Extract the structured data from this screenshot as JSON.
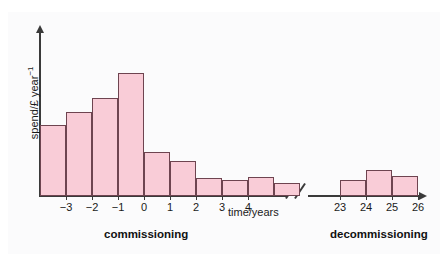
{
  "chart_data": {
    "type": "bar",
    "title": "",
    "subtitle": "",
    "xlabel": "time/years",
    "ylabel": "spend/£ year⁻¹",
    "grid": false,
    "legend_position": "none",
    "axis_break": "//",
    "axis_break_note": "x-axis broken between year 5 and year 22",
    "ylim": [
      0,
      100
    ],
    "xlim_segments": [
      [
        -4,
        5
      ],
      [
        22,
        27
      ]
    ],
    "y_axis_ticks_shown": false,
    "annotations": [
      {
        "text": "commissioning",
        "bold": true,
        "position": "below-left-segment"
      },
      {
        "text": "decommissioning",
        "bold": true,
        "position": "below-right-segment"
      }
    ],
    "xtick_labels_left": [
      "-3",
      "-2",
      "-1",
      "0",
      "1",
      "2",
      "3",
      "4"
    ],
    "xtick_labels_right": [
      "23",
      "24",
      "25",
      "26"
    ],
    "bar_color": "#f9ccd7",
    "bar_edge_color": "#6e4450",
    "axis_color": "#3a3a3a",
    "bars": [
      {
        "group": "commissioning",
        "bin_start": -4,
        "bin_end": -3,
        "label": "-4 to -3",
        "value": 43
      },
      {
        "group": "commissioning",
        "bin_start": -3,
        "bin_end": -2,
        "label": "-3 to -2",
        "value": 51
      },
      {
        "group": "commissioning",
        "bin_start": -2,
        "bin_end": -1,
        "label": "-2 to -1",
        "value": 59
      },
      {
        "group": "commissioning",
        "bin_start": -1,
        "bin_end": 0,
        "label": "-1 to 0",
        "value": 74
      },
      {
        "group": "commissioning",
        "bin_start": 0,
        "bin_end": 1,
        "label": "0 to 1",
        "value": 26
      },
      {
        "group": "commissioning",
        "bin_start": 1,
        "bin_end": 2,
        "label": "1 to 2",
        "value": 21
      },
      {
        "group": "commissioning",
        "bin_start": 2,
        "bin_end": 3,
        "label": "2 to 3",
        "value": 10
      },
      {
        "group": "commissioning",
        "bin_start": 3,
        "bin_end": 4,
        "label": "3 to 4",
        "value": 9
      },
      {
        "group": "commissioning",
        "bin_start": 4,
        "bin_end": 5,
        "label": "4 to 5",
        "value": 11
      },
      {
        "group": "commissioning",
        "bin_start": 5,
        "bin_end": 6,
        "label": "5 to 6",
        "value": 7
      },
      {
        "group": "decommissioning",
        "bin_start": 23,
        "bin_end": 24,
        "label": "23 to 24",
        "value": 9
      },
      {
        "group": "decommissioning",
        "bin_start": 24,
        "bin_end": 25,
        "label": "24 to 25",
        "value": 15
      },
      {
        "group": "decommissioning",
        "bin_start": 25,
        "bin_end": 26,
        "label": "25 to 26",
        "value": 11
      }
    ]
  },
  "labels": {
    "ylabel_main": "spend/£ year",
    "ylabel_exponent": "−1",
    "xlabel": "time/years",
    "commissioning": "commissioning",
    "decommissioning": "decommissioning"
  },
  "xticks_left": [
    {
      "label": "-3",
      "x": 66
    },
    {
      "label": "-2",
      "x": 92
    },
    {
      "label": "-1",
      "x": 118
    },
    {
      "label": "0",
      "x": 144
    },
    {
      "label": "1",
      "x": 170
    },
    {
      "label": "2",
      "x": 196
    },
    {
      "label": "3",
      "x": 222
    },
    {
      "label": "4",
      "x": 248
    }
  ],
  "xticks_right": [
    {
      "label": "23",
      "x": 340
    },
    {
      "label": "24",
      "x": 366
    },
    {
      "label": "25",
      "x": 392
    },
    {
      "label": "26",
      "x": 418
    }
  ],
  "bar_geometry_left": [
    {
      "x": 40,
      "w": 26,
      "top": 125
    },
    {
      "x": 66,
      "w": 26,
      "top": 112
    },
    {
      "x": 92,
      "w": 26,
      "top": 98
    },
    {
      "x": 118,
      "w": 26,
      "top": 73
    },
    {
      "x": 144,
      "w": 26,
      "top": 152
    },
    {
      "x": 170,
      "w": 26,
      "top": 161
    },
    {
      "x": 196,
      "w": 26,
      "top": 178
    },
    {
      "x": 222,
      "w": 26,
      "top": 180
    },
    {
      "x": 248,
      "w": 26,
      "top": 177
    },
    {
      "x": 274,
      "w": 26,
      "top": 183
    }
  ],
  "bar_geometry_right": [
    {
      "x": 340,
      "w": 26,
      "top": 180
    },
    {
      "x": 366,
      "w": 26,
      "top": 170
    },
    {
      "x": 392,
      "w": 26,
      "top": 176
    }
  ]
}
